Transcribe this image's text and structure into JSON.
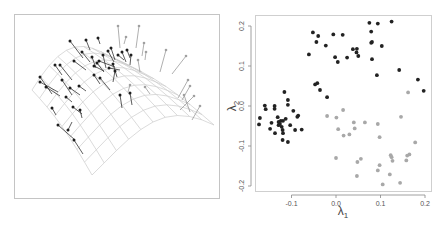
{
  "chart_data": [
    {
      "type": "surface3d",
      "title": "",
      "description": "3D wireframe of a curved (saddle/arched) surface with data points connected by residual line segments to the surface",
      "series": [
        {
          "name": "points above surface (dark)",
          "color": "#1e1e1e"
        },
        {
          "name": "points near/below surface (light)",
          "color": "#a0a0a0"
        }
      ],
      "wire_color": "#c8c8c8",
      "frame": true
    },
    {
      "type": "scatter",
      "title": "",
      "xlabel": "λ1",
      "ylabel": "λ2",
      "xlim": [
        -0.18,
        0.21
      ],
      "ylim": [
        -0.21,
        0.23
      ],
      "xticks": [
        -0.1,
        0.0,
        0.1,
        0.2
      ],
      "xtick_labels": [
        "-0.1",
        "0.0",
        "0.1",
        "0.2"
      ],
      "yticks": [
        -0.2,
        -0.1,
        0.0,
        0.1,
        0.2
      ],
      "ytick_labels": [
        "-0.2",
        "-0.1",
        "0.0",
        "0.1",
        "0.2"
      ],
      "grid": false,
      "legend": null,
      "series": [
        {
          "name": "group 1 (dark)",
          "color": "#222222",
          "points": [
            [
              -0.052,
              0.184
            ],
            [
              -0.04,
              0.175
            ],
            [
              -0.044,
              0.16
            ],
            [
              -0.023,
              0.151
            ],
            [
              -0.061,
              0.129
            ],
            [
              -0.006,
              0.179
            ],
            [
              0.015,
              0.178
            ],
            [
              -0.002,
              0.122
            ],
            [
              0.004,
              0.11
            ],
            [
              0.025,
              0.121
            ],
            [
              0.038,
              0.142
            ],
            [
              0.047,
              0.143
            ],
            [
              0.046,
              0.134
            ],
            [
              0.05,
              0.125
            ],
            [
              0.075,
              0.208
            ],
            [
              0.094,
              0.206
            ],
            [
              0.125,
              0.211
            ],
            [
              0.079,
              0.186
            ],
            [
              0.081,
              0.16
            ],
            [
              0.079,
              0.158
            ],
            [
              0.103,
              0.15
            ],
            [
              0.081,
              0.117
            ],
            [
              0.092,
              0.077
            ],
            [
              0.142,
              0.09
            ],
            [
              0.184,
              0.066
            ],
            [
              0.197,
              0.038
            ],
            [
              -0.047,
              0.054
            ],
            [
              -0.042,
              0.057
            ],
            [
              -0.036,
              0.04
            ],
            [
              -0.02,
              0.022
            ],
            [
              -0.16,
              0.001
            ],
            [
              -0.158,
              -0.008
            ],
            [
              -0.171,
              -0.03
            ],
            [
              -0.173,
              -0.046
            ],
            [
              -0.138,
              0.0
            ],
            [
              -0.138,
              -0.007
            ],
            [
              -0.116,
              0.035
            ],
            [
              -0.108,
              0.015
            ],
            [
              -0.108,
              0.003
            ],
            [
              -0.096,
              -0.012
            ],
            [
              -0.085,
              -0.024
            ],
            [
              -0.087,
              -0.027
            ],
            [
              -0.145,
              -0.042
            ],
            [
              -0.148,
              -0.057
            ],
            [
              -0.131,
              -0.028
            ],
            [
              -0.129,
              -0.04
            ],
            [
              -0.129,
              -0.048
            ],
            [
              -0.126,
              -0.045
            ],
            [
              -0.124,
              -0.037
            ],
            [
              -0.119,
              -0.037
            ],
            [
              -0.113,
              -0.032
            ],
            [
              -0.122,
              -0.052
            ],
            [
              -0.12,
              -0.06
            ],
            [
              -0.119,
              -0.068
            ],
            [
              -0.137,
              -0.068
            ],
            [
              -0.12,
              -0.085
            ],
            [
              -0.108,
              -0.09
            ],
            [
              -0.103,
              -0.048
            ],
            [
              -0.092,
              -0.06
            ],
            [
              -0.077,
              -0.059
            ]
          ]
        },
        {
          "name": "group 2 (light)",
          "color": "#a8a8a8",
          "points": [
            [
              -0.02,
              -0.025
            ],
            [
              0.001,
              -0.029
            ],
            [
              0.016,
              -0.01
            ],
            [
              0.005,
              -0.058
            ],
            [
              0.017,
              -0.074
            ],
            [
              0.03,
              -0.071
            ],
            [
              0.04,
              -0.041
            ],
            [
              0.042,
              -0.056
            ],
            [
              0.065,
              -0.041
            ],
            [
              0.094,
              -0.045
            ],
            [
              0.098,
              -0.078
            ],
            [
              0.0,
              -0.13
            ],
            [
              0.048,
              -0.14
            ],
            [
              0.056,
              -0.132
            ],
            [
              0.047,
              -0.175
            ],
            [
              0.094,
              -0.161
            ],
            [
              0.098,
              -0.148
            ],
            [
              0.123,
              -0.123
            ],
            [
              0.125,
              -0.128
            ],
            [
              0.127,
              -0.137
            ],
            [
              0.121,
              -0.171
            ],
            [
              0.105,
              -0.196
            ],
            [
              0.144,
              -0.192
            ],
            [
              0.146,
              -0.027
            ],
            [
              0.162,
              0.034
            ],
            [
              0.178,
              -0.091
            ],
            [
              0.158,
              -0.136
            ],
            [
              0.165,
              -0.121
            ],
            [
              0.16,
              -0.124
            ]
          ]
        }
      ]
    }
  ]
}
